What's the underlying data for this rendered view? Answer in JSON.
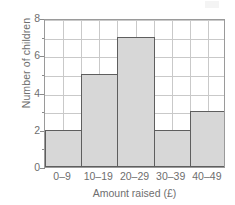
{
  "chart_data": {
    "type": "bar",
    "title": "",
    "subtitle": "",
    "xlabel": "Amount raised (£)",
    "ylabel": "Number of children",
    "categories": [
      "0–9",
      "10–19",
      "20–29",
      "30–39",
      "40–49"
    ],
    "values": [
      2,
      5,
      7,
      2,
      3
    ],
    "series": [
      {
        "name": "Number of children",
        "values": [
          2,
          5,
          7,
          2,
          3
        ]
      }
    ],
    "ylim": [
      0,
      8
    ],
    "y_major_ticks": [
      0,
      2,
      4,
      6,
      8
    ],
    "y_major_tick_labels": [
      "0",
      "2",
      "4",
      "6",
      "8"
    ],
    "y_minor_ticks": [
      1,
      3,
      5,
      7
    ],
    "y_gridline_step": 1,
    "x_gridlines_per_category": 2,
    "grid": true,
    "legend": false,
    "legend_position": "none",
    "annotations": [],
    "colors": {
      "bar_fill": "#d7d7d7",
      "bar_border": "#5e5e5e",
      "gridline": "#c9c9c9",
      "axis_line": "#9a9a9a",
      "text": "#6e6e6e",
      "background": "#ffffff"
    }
  }
}
